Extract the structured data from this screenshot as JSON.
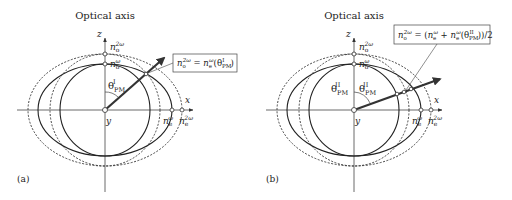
{
  "panels": [
    {
      "id": "a",
      "panel_label": "(a)",
      "axis_title": "Optical axis",
      "z_label": "z",
      "x_label": "x",
      "y_label": "y",
      "n_o_2w": {
        "base": "n",
        "sub": "o",
        "sup": "2ω"
      },
      "n_o_w": {
        "base": "n",
        "sub": "o",
        "sup": "ω"
      },
      "n_e_w": {
        "base": "n",
        "sub": "e",
        "sup": "ω"
      },
      "n_e_2w": {
        "base": "n",
        "sub": "e",
        "sup": "2ω"
      },
      "theta": {
        "base": "θ",
        "sub": "PM",
        "sup": "I"
      },
      "equation": "n_o^{2ω} = n_e^{ω}(θ_PM^I)",
      "equation_parts": {
        "lhs_base": "n",
        "lhs_sub": "o",
        "lhs_sup": "2ω",
        "eq": " = ",
        "rhs_base": "n",
        "rhs_sub": "e",
        "rhs_sup": "ω",
        "arg_open": "(θ",
        "arg_sub": "PM",
        "arg_sup": "I",
        "arg_close": ")"
      }
    },
    {
      "id": "b",
      "panel_label": "(b)",
      "axis_title": "Optical axis",
      "z_label": "z",
      "x_label": "x",
      "y_label": "y",
      "n_o_2w": {
        "base": "n",
        "sub": "o",
        "sup": "2ω"
      },
      "n_o_w": {
        "base": "n",
        "sub": "o",
        "sup": "ω"
      },
      "n_e_w": {
        "base": "n",
        "sub": "e",
        "sup": "ω"
      },
      "n_e_2w": {
        "base": "n",
        "sub": "e",
        "sup": "2ω"
      },
      "theta_left": {
        "base": "θ",
        "sub": "PM",
        "sup": "II"
      },
      "theta_right": {
        "base": "θ",
        "sub": "PM",
        "sup": "II"
      },
      "equation": "n_o^{2ω} = (n_e^{ω} + n_e^{ω}(θ_PM^II))/2",
      "equation_parts": {
        "lhs_base": "n",
        "lhs_sub": "o",
        "lhs_sup": "2ω",
        "eq": " = (",
        "t1_base": "n",
        "t1_sub": "e",
        "t1_sup": "ω",
        "plus": " + ",
        "t2_base": "n",
        "t2_sub": "e",
        "t2_sup": "ω",
        "arg_open": "(θ",
        "arg_sub": "PM",
        "arg_sup": "II",
        "arg_close": "))/2"
      }
    }
  ],
  "colors": {
    "stroke": "#333333",
    "text": "#222222",
    "background": "#ffffff"
  }
}
